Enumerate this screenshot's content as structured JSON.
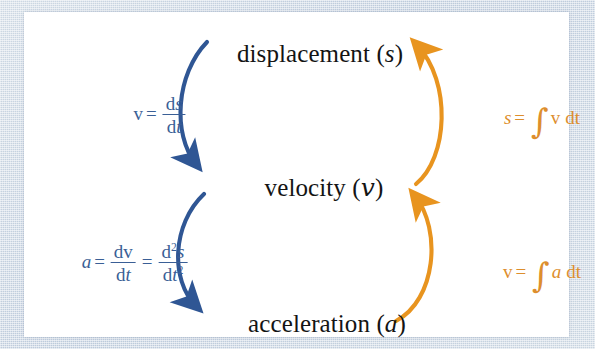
{
  "diagram": {
    "colors": {
      "differentiation_blue": "#3a5f96",
      "integration_orange": "#dd8e2d",
      "panel_background": "#ffffff",
      "border_background": "#c3d0dd",
      "label_text": "#141414"
    },
    "nodes": [
      {
        "id": "displacement",
        "name": "displacement",
        "symbol": "s",
        "label": "displacement (s)"
      },
      {
        "id": "velocity",
        "name": "velocity",
        "symbol": "v",
        "label": "velocity (v)"
      },
      {
        "id": "acceleration",
        "name": "acceleration",
        "symbol": "a",
        "label": "acceleration (a)"
      }
    ],
    "edges": [
      {
        "id": "displacement-to-velocity",
        "from": "displacement",
        "to": "velocity",
        "side": "left",
        "operation": "differentiate",
        "color": "#3a5f96",
        "formula_text": "v = ds/dt",
        "parts": {
          "lhs": "v",
          "equals": "=",
          "numerator": "ds",
          "denominator": "dt"
        }
      },
      {
        "id": "velocity-to-acceleration",
        "from": "velocity",
        "to": "acceleration",
        "side": "left",
        "operation": "differentiate",
        "color": "#3a5f96",
        "formula_text": "a = dv/dt = d²s/dt²",
        "parts": {
          "lhs": "a",
          "equals": "=",
          "numerator1": "dv",
          "denominator1": "dt",
          "equals2": "=",
          "numerator2": "d²s",
          "denominator2": "dt²"
        }
      },
      {
        "id": "velocity-to-displacement",
        "from": "velocity",
        "to": "displacement",
        "side": "right",
        "operation": "integrate",
        "color": "#dd8e2d",
        "formula_text": "s = ∫v dt",
        "parts": {
          "lhs": "s",
          "equals": "=",
          "integral": "∫",
          "integrand": "v",
          "differential": "dt"
        }
      },
      {
        "id": "acceleration-to-velocity",
        "from": "acceleration",
        "to": "velocity",
        "side": "right",
        "operation": "integrate",
        "color": "#dd8e2d",
        "formula_text": "v = ∫a dt",
        "parts": {
          "lhs": "v",
          "equals": "=",
          "integral": "∫",
          "integrand": "a",
          "differential": "dt"
        }
      }
    ]
  }
}
